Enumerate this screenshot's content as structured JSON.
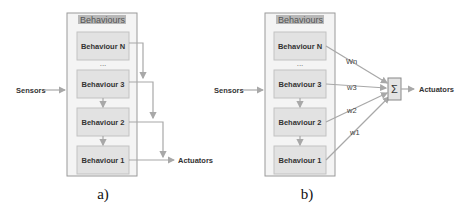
{
  "diagram_a": {
    "container_title": "Behaviours",
    "behaviours": [
      "Behaviour N",
      "...",
      "Behaviour 3",
      "Behaviour 2",
      "Behaviour 1"
    ],
    "input_label": "Sensors",
    "output_label": "Actuators",
    "caption": "a)"
  },
  "diagram_b": {
    "container_title": "Behaviours",
    "behaviours": [
      "Behaviour N",
      "...",
      "Behaviour 3",
      "Behaviour 2",
      "Behaviour 1"
    ],
    "input_label": "Sensors",
    "output_label": "Actuators",
    "weights": [
      "Wn",
      "w3",
      "w2",
      "w1"
    ],
    "sum_symbol": "Σ",
    "caption": "b)"
  }
}
